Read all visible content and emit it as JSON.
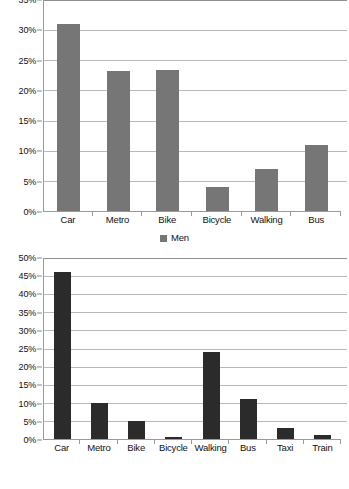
{
  "chart_data": [
    {
      "type": "bar",
      "name": "men-transport-modal-share",
      "title": "",
      "xlabel": "",
      "ylabel": "",
      "categories": [
        "Car",
        "Metro",
        "Bike",
        "Bicycle",
        "Walking",
        "Bus"
      ],
      "values": [
        31,
        23.2,
        23.4,
        4,
        7,
        11
      ],
      "series": [
        {
          "name": "Men",
          "values": [
            31,
            23.2,
            23.4,
            4,
            7,
            11
          ],
          "color": "#767676"
        }
      ],
      "legend": [
        "Men"
      ],
      "legend_position": "bottom-center",
      "ylim": [
        0,
        35
      ],
      "ytick_step": 5,
      "ytick_labels": [
        "0%",
        "5%",
        "10%",
        "15%",
        "20%",
        "25%",
        "30%",
        "35%"
      ],
      "grid": true,
      "value_suffix": "%"
    },
    {
      "type": "bar",
      "name": "women-transport-modal-share",
      "title": "",
      "xlabel": "",
      "ylabel": "",
      "categories": [
        "Car",
        "Metro",
        "Bike",
        "Bicycle",
        "Walking",
        "Bus",
        "Taxi",
        "Train"
      ],
      "values": [
        46,
        10,
        5,
        0.5,
        24,
        11,
        3,
        1
      ],
      "series": [
        {
          "name": "Women",
          "values": [
            46,
            10,
            5,
            0.5,
            24,
            11,
            3,
            1
          ],
          "color": "#2b2b2b"
        }
      ],
      "legend": [
        "Women"
      ],
      "legend_position": "bottom-center",
      "ylim": [
        0,
        50
      ],
      "ytick_step": 5,
      "ytick_labels": [
        "0%",
        "5%",
        "10%",
        "15%",
        "20%",
        "25%",
        "30%",
        "35%",
        "40%",
        "45%",
        "50%"
      ],
      "grid": true,
      "value_suffix": "%"
    }
  ]
}
